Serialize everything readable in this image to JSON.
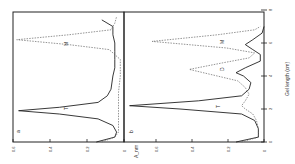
{
  "chart_data": [
    {
      "panel": "a",
      "type": "line",
      "orientation": "rotated-90",
      "xlabel": "Gel length (cm)",
      "ylabel": "A_nm",
      "xlim": [
        0,
        8
      ],
      "ylim": [
        0,
        0.6
      ],
      "x_ticks": [
        "0",
        "2",
        "4",
        "6",
        "8"
      ],
      "y_ticks": [
        "0",
        "0.2",
        "0.4",
        "0.6"
      ],
      "grid": false,
      "annotations": [
        {
          "text": "T",
          "x": 2.0,
          "y": 0.3
        },
        {
          "text": "M",
          "x": 6.0,
          "y": 0.3
        }
      ],
      "series": [
        {
          "name": "solid",
          "style": "solid",
          "x": [
            0.0,
            0.3,
            0.6,
            1.0,
            1.4,
            1.7,
            1.9,
            2.1,
            2.4,
            2.8,
            3.2,
            4.0,
            4.5,
            5.0,
            5.5,
            6.0,
            6.5,
            7.0,
            7.4
          ],
          "values": [
            0.15,
            0.05,
            0.04,
            0.06,
            0.14,
            0.35,
            0.57,
            0.35,
            0.14,
            0.09,
            0.07,
            0.06,
            0.05,
            0.05,
            0.05,
            0.05,
            0.06,
            0.06,
            0.12
          ]
        },
        {
          "name": "dashed",
          "style": "dashed",
          "x": [
            0.0,
            0.3,
            0.6,
            1.0,
            2.0,
            3.0,
            4.0,
            5.0,
            5.6,
            5.9,
            6.2,
            6.5,
            6.8,
            7.2,
            7.6
          ],
          "values": [
            0.12,
            0.05,
            0.03,
            0.03,
            0.03,
            0.03,
            0.02,
            0.02,
            0.08,
            0.3,
            0.58,
            0.3,
            0.07,
            0.05,
            0.04
          ]
        }
      ]
    },
    {
      "panel": "b",
      "type": "line",
      "orientation": "rotated-90",
      "xlabel": "Gel length (cm)",
      "ylabel": "A_nm",
      "xlim": [
        0,
        8
      ],
      "ylim": [
        0,
        0.75
      ],
      "x_ticks": [
        "0",
        "2",
        "4",
        "6",
        "8"
      ],
      "y_ticks": [
        "0.2",
        "0.4",
        "0.6"
      ],
      "grid": false,
      "annotations": [
        {
          "text": "T",
          "x": 2.2,
          "y": 0.35
        },
        {
          "text": "D",
          "x": 4.4,
          "y": 0.25
        },
        {
          "text": "M",
          "x": 6.1,
          "y": 0.25
        }
      ],
      "series": [
        {
          "name": "solid",
          "style": "solid",
          "x": [
            0.0,
            0.3,
            0.8,
            1.3,
            1.7,
            2.0,
            2.2,
            2.5,
            2.8,
            3.2,
            3.6,
            4.0,
            4.2,
            4.5,
            4.9,
            5.3,
            5.6,
            5.9,
            6.2,
            6.6,
            7.0
          ],
          "values": [
            0.15,
            0.03,
            0.03,
            0.05,
            0.12,
            0.45,
            0.72,
            0.35,
            0.12,
            0.08,
            0.07,
            0.11,
            0.15,
            0.1,
            0.02,
            0.02,
            0.06,
            0.1,
            0.06,
            0.01,
            0.0
          ]
        },
        {
          "name": "dashed",
          "style": "dashed",
          "x": [
            0.0,
            0.3,
            0.8,
            1.3,
            1.7,
            2.0,
            2.2,
            2.5,
            2.9,
            3.3,
            3.7,
            4.0,
            4.4,
            4.8,
            5.1,
            5.4,
            5.7,
            6.1,
            6.5,
            6.8,
            7.0
          ],
          "values": [
            0.12,
            0.03,
            0.03,
            0.04,
            0.06,
            0.1,
            0.12,
            0.1,
            0.08,
            0.1,
            0.14,
            0.25,
            0.4,
            0.22,
            0.08,
            0.05,
            0.2,
            0.6,
            0.25,
            0.05,
            0.02
          ]
        }
      ]
    }
  ],
  "labels": {
    "panel_a": "a",
    "panel_b": "b",
    "gel_axis_title": "Gel length (cm)",
    "absorbance_axis_title": "A_nm",
    "peak_T": "T",
    "peak_D": "D",
    "peak_M": "M",
    "a_ticks": [
      "0.6",
      "0.4",
      "0.2",
      "0"
    ],
    "b_ticks": [
      "0.6",
      "0.4",
      "0.2",
      "0"
    ],
    "gel_ticks": [
      "0",
      "2",
      "4",
      "6",
      "8"
    ]
  }
}
